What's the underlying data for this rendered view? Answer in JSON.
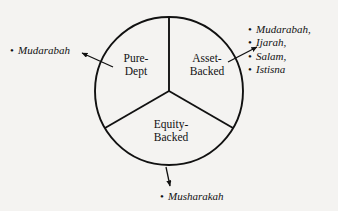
{
  "diagram": {
    "type": "three-segment-circle",
    "stroke_color": "#111111",
    "background_color": "#f4f3f1",
    "circle": {
      "center_x": 169,
      "center_y": 91,
      "radius": 74
    },
    "segments": [
      {
        "id": "pure-dept",
        "label_line1": "Pure-",
        "label_line2": "Dept",
        "position": "left"
      },
      {
        "id": "asset-backed",
        "label_line1": "Asset-",
        "label_line2": "Backed",
        "position": "right"
      },
      {
        "id": "equity-backed",
        "label_line1": "Equity-",
        "label_line2": "Backed",
        "position": "bottom"
      }
    ],
    "callouts": [
      {
        "id": "left",
        "for_segment": "pure-dept",
        "items": [
          "Mudarabah"
        ]
      },
      {
        "id": "right",
        "for_segment": "asset-backed",
        "items": [
          "Mudarabah,",
          "Ijarah,",
          "Salam,",
          "Istisna"
        ]
      },
      {
        "id": "bottom",
        "for_segment": "equity-backed",
        "items": [
          "Musharakah"
        ]
      }
    ],
    "bullet_glyph": "•"
  }
}
